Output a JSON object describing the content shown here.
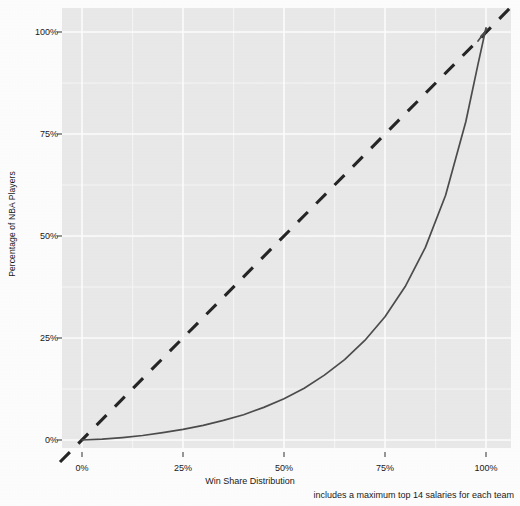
{
  "chart_data": {
    "type": "line",
    "title": "",
    "xlabel": "Win Share Distribution",
    "ylabel": "Percentage of NBA Players",
    "caption": "includes a maximum top 14 salaries for each team",
    "xlim": [
      0,
      100
    ],
    "ylim": [
      0,
      100
    ],
    "grid": true,
    "legend": "none",
    "x_ticks": [
      {
        "value": 0,
        "label": "0%"
      },
      {
        "value": 25,
        "label": "25%"
      },
      {
        "value": 50,
        "label": "50%"
      },
      {
        "value": 75,
        "label": "75%"
      },
      {
        "value": 100,
        "label": "100%"
      }
    ],
    "y_ticks": [
      {
        "value": 0,
        "label": "0%"
      },
      {
        "value": 25,
        "label": "25%"
      },
      {
        "value": 50,
        "label": "50%"
      },
      {
        "value": 75,
        "label": "75%"
      },
      {
        "value": 100,
        "label": "100%"
      }
    ],
    "minor_gridlines": [
      12.5,
      37.5,
      62.5,
      87.5
    ],
    "series": [
      {
        "name": "Lorenz curve",
        "style": "solid",
        "color": "#4d4d4d",
        "x": [
          0,
          5,
          10,
          15,
          20,
          25,
          30,
          35,
          40,
          45,
          50,
          55,
          60,
          65,
          70,
          75,
          80,
          85,
          90,
          95,
          98,
          100
        ],
        "y": [
          0,
          0.2,
          0.6,
          1.1,
          1.8,
          2.6,
          3.6,
          4.8,
          6.2,
          8.0,
          10.1,
          12.7,
          15.9,
          19.7,
          24.4,
          30.2,
          37.6,
          47.2,
          60.0,
          78.0,
          92.0,
          101.0
        ]
      },
      {
        "name": "Line of equality",
        "style": "dashed",
        "color": "#262626",
        "x": [
          -3,
          103
        ],
        "y": [
          -3,
          103
        ]
      }
    ]
  },
  "panel": {
    "background_color": "#ebebeb",
    "gridline_color": "#ffffff",
    "plot_left": 62,
    "plot_right": 511,
    "plot_top": 8,
    "plot_bottom": 448,
    "x0": 82,
    "x100": 486,
    "y0": 440,
    "y100": 32
  }
}
